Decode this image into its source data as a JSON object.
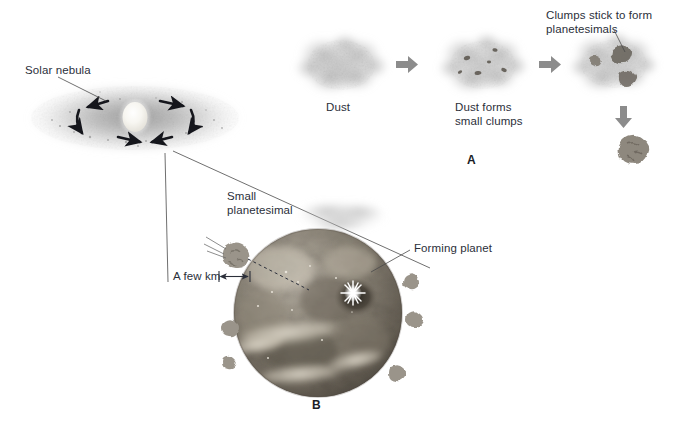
{
  "figure": {
    "background_color": "#ffffff",
    "text_color": "#2b2f3a",
    "width": 676,
    "height": 432
  },
  "labels": {
    "solar_nebula": "Solar nebula",
    "dust": "Dust",
    "dust_forms_clumps_line1": "Dust forms",
    "dust_forms_clumps_line2": "small clumps",
    "clumps_stick_line1": "Clumps stick to form",
    "clumps_stick_line2": "planetesimals",
    "small_planetesimal_line1": "Small",
    "small_planetesimal_line2": "planetesimal",
    "a_few_km": "A few km",
    "forming_planet": "Forming planet"
  },
  "panels": [
    {
      "letter": "A",
      "caption": "Dust grains collide and stick together to build planetesimals",
      "stages": [
        {
          "name": "dust-cloud",
          "label": "Dust"
        },
        {
          "name": "dust-clumps-cloud",
          "label": "Dust forms small clumps"
        },
        {
          "name": "planetesimal-cloud",
          "label": "Clumps stick to form planetesimals"
        }
      ],
      "arrow_color": "#8a8a8a",
      "arrow_count": 3
    },
    {
      "letter": "B",
      "caption": "Planetesimals bombard the growing protoplanet",
      "elements": [
        {
          "name": "forming-planet",
          "label": "Forming planet"
        },
        {
          "name": "small-planetesimal",
          "label": "Small planetesimal"
        },
        {
          "name": "scale-dimension",
          "label": "A few km"
        },
        {
          "name": "impact-flash",
          "label": ""
        }
      ]
    }
  ],
  "colors": {
    "nebula_gray": "#b9b9b9",
    "protosun": "#f2f0e8",
    "arrow_black": "#15161c",
    "block_arrow": "#8c8c8c",
    "planet_dark": "#6f6a62",
    "planet_light": "#cfc9bd",
    "leader_line": "#4a4a4a",
    "rock_gray": "#9a958d"
  }
}
